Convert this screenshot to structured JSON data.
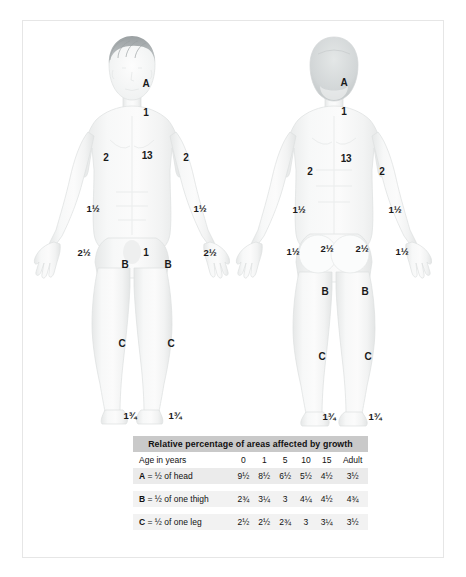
{
  "chart_data": {
    "type": "table",
    "title": "Relative percentage of areas affected by growth",
    "columns": [
      "Age in years",
      "0",
      "1",
      "5",
      "10",
      "15",
      "Adult"
    ],
    "rows": [
      {
        "key": "A",
        "label": "= ½ of head",
        "values": [
          "9½",
          "8½",
          "6½",
          "5½",
          "4½",
          "3½"
        ]
      },
      {
        "key": "B",
        "label": "= ½ of one thigh",
        "values": [
          "2¾",
          "3¼",
          "3",
          "4¼",
          "4½",
          "4¾"
        ]
      },
      {
        "key": "C",
        "label": "= ½ of one leg",
        "values": [
          "2½",
          "2½",
          "2¾",
          "3",
          "3¼",
          "3½"
        ]
      }
    ]
  },
  "table": {
    "title": "Relative percentage of areas affected by growth",
    "age_header": "Age in years",
    "age_columns": [
      "0",
      "1",
      "5",
      "10",
      "15",
      "Adult"
    ],
    "rows": [
      {
        "key": "A",
        "label": "= ½ of head",
        "v0": "9½",
        "v1": "8½",
        "v5": "6½",
        "v10": "5½",
        "v15": "4½",
        "vadult": "3½"
      },
      {
        "key": "B",
        "label": "= ½ of one thigh",
        "v0": "2¾",
        "v1": "3¼",
        "v5": "3",
        "v10": "4¼",
        "v15": "4½",
        "vadult": "4¾"
      },
      {
        "key": "C",
        "label": "= ½ of one leg",
        "v0": "2½",
        "v1": "2½",
        "v5": "2¾",
        "v10": "3",
        "v15": "3¼",
        "vadult": "3½"
      }
    ]
  },
  "anterior": {
    "name": "anterior-body-diagram",
    "labels": [
      {
        "id": "ant-head-A",
        "text": "A",
        "x": 124,
        "y": 64
      },
      {
        "id": "ant-neck",
        "text": "1",
        "x": 124,
        "y": 93
      },
      {
        "id": "ant-chest-left",
        "text": "2",
        "x": 84,
        "y": 138
      },
      {
        "id": "ant-trunk",
        "text": "13",
        "x": 125,
        "y": 136
      },
      {
        "id": "ant-chest-right",
        "text": "2",
        "x": 164,
        "y": 138
      },
      {
        "id": "ant-forearm-left",
        "text": "1½",
        "x": 71,
        "y": 189
      },
      {
        "id": "ant-forearm-right",
        "text": "1½",
        "x": 178,
        "y": 189
      },
      {
        "id": "ant-hand-left",
        "text": "2½",
        "x": 62,
        "y": 233
      },
      {
        "id": "ant-hand-right",
        "text": "2½",
        "x": 188,
        "y": 233
      },
      {
        "id": "ant-genital",
        "text": "1",
        "x": 124,
        "y": 233
      },
      {
        "id": "ant-thigh-left-B",
        "text": "B",
        "x": 103,
        "y": 245
      },
      {
        "id": "ant-thigh-right-B",
        "text": "B",
        "x": 146,
        "y": 245
      },
      {
        "id": "ant-leg-left-C",
        "text": "C",
        "x": 100,
        "y": 324
      },
      {
        "id": "ant-leg-right-C",
        "text": "C",
        "x": 149,
        "y": 324
      },
      {
        "id": "ant-foot-left",
        "text": "1¾",
        "x": 108,
        "y": 396
      },
      {
        "id": "ant-foot-right",
        "text": "1¾",
        "x": 153,
        "y": 396
      }
    ]
  },
  "posterior": {
    "name": "posterior-body-diagram",
    "labels": [
      {
        "id": "post-head-A",
        "text": "A",
        "x": 322,
        "y": 63
      },
      {
        "id": "post-neck",
        "text": "1",
        "x": 322,
        "y": 92
      },
      {
        "id": "post-back-left",
        "text": "2",
        "x": 288,
        "y": 152
      },
      {
        "id": "post-trunk",
        "text": "13",
        "x": 324,
        "y": 139
      },
      {
        "id": "post-back-right",
        "text": "2",
        "x": 360,
        "y": 152
      },
      {
        "id": "post-forearm-left",
        "text": "1½",
        "x": 277,
        "y": 190
      },
      {
        "id": "post-forearm-right",
        "text": "1½",
        "x": 373,
        "y": 190
      },
      {
        "id": "post-hand-left",
        "text": "1½",
        "x": 271,
        "y": 232
      },
      {
        "id": "post-hand-right",
        "text": "1½",
        "x": 380,
        "y": 232
      },
      {
        "id": "post-buttock-left",
        "text": "2½",
        "x": 305,
        "y": 229
      },
      {
        "id": "post-buttock-right",
        "text": "2½",
        "x": 340,
        "y": 229
      },
      {
        "id": "post-thigh-left-B",
        "text": "B",
        "x": 303,
        "y": 272
      },
      {
        "id": "post-thigh-right-B",
        "text": "B",
        "x": 343,
        "y": 272
      },
      {
        "id": "post-leg-left-C",
        "text": "C",
        "x": 300,
        "y": 337
      },
      {
        "id": "post-leg-right-C",
        "text": "C",
        "x": 346,
        "y": 337
      },
      {
        "id": "post-foot-left",
        "text": "1¾",
        "x": 307,
        "y": 397
      },
      {
        "id": "post-foot-right",
        "text": "1¾",
        "x": 353,
        "y": 397
      }
    ]
  },
  "colors": {
    "skin_light": "#f4f5f5",
    "skin_shade": "#e9ebeb",
    "hair_front": "#8f9496",
    "hair_back": "#c3c7c8",
    "outline": "#d8dcdc",
    "text": "#1a1a1a",
    "table_header_bg": "#c9c9c9",
    "table_row_bg": "#f2f2f2",
    "frame_border": "#e6e6e6"
  }
}
